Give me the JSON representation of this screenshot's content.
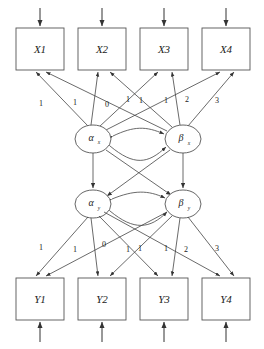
{
  "diagram": {
    "type": "structural-equation-model",
    "title": "",
    "canvas": {
      "width": 264,
      "height": 349,
      "background": "#ffffff"
    },
    "stroke_color": "#444444",
    "box_stroke_color": "#555555",
    "text_color": "#222222"
  },
  "observed_top": {
    "group_name": "x-indicators",
    "boxes": [
      {
        "id": "x1",
        "label": "X1",
        "x": 16,
        "y": 28,
        "w": 48,
        "h": 42
      },
      {
        "id": "x2",
        "label": "X2",
        "x": 78,
        "y": 28,
        "w": 48,
        "h": 42
      },
      {
        "id": "x3",
        "label": "X3",
        "x": 140,
        "y": 28,
        "w": 48,
        "h": 42
      },
      {
        "id": "x4",
        "label": "X4",
        "x": 202,
        "y": 28,
        "w": 48,
        "h": 42
      }
    ]
  },
  "observed_bottom": {
    "group_name": "y-indicators",
    "boxes": [
      {
        "id": "y1",
        "label": "Y1",
        "x": 16,
        "y": 278,
        "w": 48,
        "h": 42
      },
      {
        "id": "y2",
        "label": "Y2",
        "x": 78,
        "y": 278,
        "w": 48,
        "h": 42
      },
      {
        "id": "y3",
        "label": "Y3",
        "x": 140,
        "y": 278,
        "w": 48,
        "h": 42
      },
      {
        "id": "y4",
        "label": "Y4",
        "x": 202,
        "y": 278,
        "w": 48,
        "h": 42
      }
    ]
  },
  "latent_nodes": [
    {
      "id": "alpha_x",
      "symbol": "α",
      "subscript": "x",
      "cx": 93,
      "cy": 139,
      "rx": 18,
      "ry": 14
    },
    {
      "id": "beta_x",
      "symbol": "β",
      "subscript": "x",
      "cx": 183,
      "cy": 139,
      "rx": 18,
      "ry": 14
    },
    {
      "id": "alpha_y",
      "symbol": "α",
      "subscript": "y",
      "cx": 93,
      "cy": 204,
      "rx": 18,
      "ry": 14
    },
    {
      "id": "beta_y",
      "symbol": "β",
      "subscript": "y",
      "cx": 183,
      "cy": 204,
      "rx": 18,
      "ry": 14
    }
  ],
  "loadings_top": {
    "description": "Factor loadings from alpha_x and beta_x to X1-X4",
    "intercept_loadings": [
      "1",
      "1",
      "1",
      "1"
    ],
    "slope_loadings": [
      "0",
      "1",
      "2",
      "3"
    ],
    "labels": [
      {
        "text": "1",
        "x": 41,
        "y": 104
      },
      {
        "text": "1",
        "x": 75,
        "y": 103
      },
      {
        "text": "0",
        "x": 107,
        "y": 105
      },
      {
        "text": "1",
        "x": 128,
        "y": 100
      },
      {
        "text": "1",
        "x": 141,
        "y": 101
      },
      {
        "text": "1",
        "x": 166,
        "y": 101
      },
      {
        "text": "2",
        "x": 187,
        "y": 100
      },
      {
        "text": "3",
        "x": 217,
        "y": 101
      }
    ]
  },
  "loadings_bottom": {
    "description": "Factor loadings from alpha_y and beta_y to Y1-Y4",
    "intercept_loadings": [
      "1",
      "1",
      "1",
      "1"
    ],
    "slope_loadings": [
      "0",
      "1",
      "2",
      "3"
    ],
    "labels": [
      {
        "text": "1",
        "x": 41,
        "y": 248
      },
      {
        "text": "1",
        "x": 75,
        "y": 250
      },
      {
        "text": "0",
        "x": 104,
        "y": 245
      },
      {
        "text": "1",
        "x": 128,
        "y": 250
      },
      {
        "text": "1",
        "x": 140,
        "y": 249
      },
      {
        "text": "1",
        "x": 166,
        "y": 249
      },
      {
        "text": "2",
        "x": 186,
        "y": 250
      },
      {
        "text": "3",
        "x": 217,
        "y": 249
      }
    ]
  },
  "residual_arrows_top": {
    "description": "Disturbance arrows pointing down into each X box",
    "arrows": [
      {
        "x": 40,
        "y1": 8,
        "y2": 27
      },
      {
        "x": 102,
        "y1": 8,
        "y2": 27
      },
      {
        "x": 164,
        "y1": 8,
        "y2": 27
      },
      {
        "x": 226,
        "y1": 8,
        "y2": 27
      }
    ]
  },
  "residual_arrows_bottom": {
    "description": "Disturbance arrows pointing up into each Y box",
    "arrows": [
      {
        "x": 40,
        "y1": 342,
        "y2": 321
      },
      {
        "x": 102,
        "y1": 342,
        "y2": 321
      },
      {
        "x": 164,
        "y1": 342,
        "y2": 321
      },
      {
        "x": 226,
        "y1": 342,
        "y2": 321
      }
    ]
  },
  "covariances": [
    {
      "id": "cov-alphax-betax",
      "from": "alpha_x",
      "to": "beta_x",
      "style": "double-headed-curve"
    },
    {
      "id": "cov-alphay-betay",
      "from": "alpha_y",
      "to": "beta_y",
      "style": "double-headed-curve"
    }
  ],
  "structural_paths": [
    {
      "id": "path-alphax-alphay",
      "from": "alpha_x",
      "to": "alpha_y",
      "style": "straight"
    },
    {
      "id": "path-betax-betay",
      "from": "beta_x",
      "to": "beta_y",
      "style": "straight"
    },
    {
      "id": "path-alphax-betay",
      "from": "alpha_x",
      "to": "beta_y",
      "style": "cross-lagged"
    },
    {
      "id": "path-betax-alphay",
      "from": "beta_x",
      "to": "alpha_y",
      "style": "cross-lagged"
    }
  ]
}
